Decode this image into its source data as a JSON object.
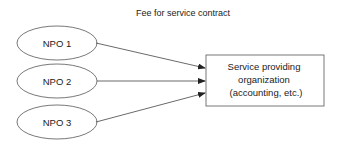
{
  "diagram": {
    "title": "Fee for service contract",
    "nodes": [
      {
        "id": "npo1",
        "label": "NPO 1",
        "shape": "ellipse"
      },
      {
        "id": "npo2",
        "label": "NPO 2",
        "shape": "ellipse"
      },
      {
        "id": "npo3",
        "label": "NPO 3",
        "shape": "ellipse"
      }
    ],
    "target": {
      "id": "service-org",
      "shape": "rectangle",
      "lines": [
        "Service providing",
        "organization",
        "(accounting, etc.)"
      ]
    },
    "edges": [
      {
        "from": "npo1",
        "to": "service-org"
      },
      {
        "from": "npo2",
        "to": "service-org"
      },
      {
        "from": "npo3",
        "to": "service-org"
      }
    ],
    "colors": {
      "stroke": "#444444",
      "text": "#222222",
      "background": "#ffffff"
    }
  }
}
